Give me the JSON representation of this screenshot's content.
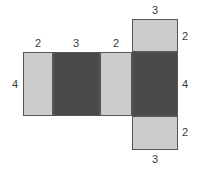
{
  "figure": {
    "type": "net-of-rectangular-prism",
    "title": "",
    "colors": {
      "light_face": "#cccccc",
      "dark_face": "#4a4a4a",
      "stroke": "#555555",
      "label_text": "#3a3a3a",
      "background": "#ffffff"
    },
    "faces": [
      {
        "id": "face-left-light",
        "shade": "light",
        "x": 23,
        "y": 52,
        "w": 30,
        "h": 64,
        "width_label": "2",
        "height_label": "4"
      },
      {
        "id": "face-front-dark",
        "shade": "dark",
        "x": 53,
        "y": 52,
        "w": 47,
        "h": 64,
        "width_label": "3",
        "height_label": "4"
      },
      {
        "id": "face-right-light",
        "shade": "light",
        "x": 100,
        "y": 52,
        "w": 32,
        "h": 64,
        "width_label": "2",
        "height_label": "4"
      },
      {
        "id": "face-back-dark",
        "shade": "dark",
        "x": 132,
        "y": 52,
        "w": 46,
        "h": 64,
        "width_label": "3",
        "height_label": "4"
      },
      {
        "id": "face-top-light",
        "shade": "light",
        "x": 132,
        "y": 19,
        "w": 46,
        "h": 33,
        "width_label": "3",
        "height_label": "2"
      },
      {
        "id": "face-bottom-light",
        "shade": "light",
        "x": 132,
        "y": 116,
        "w": 46,
        "h": 34,
        "width_label": "3",
        "height_label": "2"
      }
    ],
    "labels": [
      {
        "id": "label-top-flap-width",
        "text": "3",
        "x": 138,
        "y": 5,
        "w": 34,
        "align": "center"
      },
      {
        "id": "label-col1-width",
        "text": "2",
        "x": 21,
        "y": 38,
        "w": 34,
        "align": "center"
      },
      {
        "id": "label-col2-width",
        "text": "3",
        "x": 59,
        "y": 38,
        "w": 34,
        "align": "center"
      },
      {
        "id": "label-col3-width",
        "text": "2",
        "x": 99,
        "y": 38,
        "w": 34,
        "align": "center"
      },
      {
        "id": "label-top-flap-height",
        "text": "2",
        "x": 182,
        "y": 31,
        "w": 14,
        "align": "left"
      },
      {
        "id": "label-row-height-left",
        "text": "4",
        "x": 4,
        "y": 79,
        "w": 14,
        "align": "right"
      },
      {
        "id": "label-row-height-right",
        "text": "4",
        "x": 182,
        "y": 79,
        "w": 14,
        "align": "left"
      },
      {
        "id": "label-bottom-flap-height",
        "text": "2",
        "x": 182,
        "y": 127,
        "w": 14,
        "align": "left"
      },
      {
        "id": "label-bottom-flap-width",
        "text": "3",
        "x": 138,
        "y": 154,
        "w": 34,
        "align": "center"
      }
    ]
  },
  "chart_data": {
    "type": "diagram",
    "dimensions": {
      "length": 3,
      "width": 2,
      "height": 4
    },
    "labeled_edges": [
      {
        "position": "above-top-flap",
        "value": "3"
      },
      {
        "position": "above-column-1",
        "value": "2"
      },
      {
        "position": "above-column-2",
        "value": "3"
      },
      {
        "position": "above-column-3",
        "value": "2"
      },
      {
        "position": "right-of-top-flap",
        "value": "2"
      },
      {
        "position": "left-of-main-row",
        "value": "4"
      },
      {
        "position": "right-of-main-row",
        "value": "4"
      },
      {
        "position": "right-of-bottom-flap",
        "value": "2"
      },
      {
        "position": "below-bottom-flap",
        "value": "3"
      }
    ]
  }
}
